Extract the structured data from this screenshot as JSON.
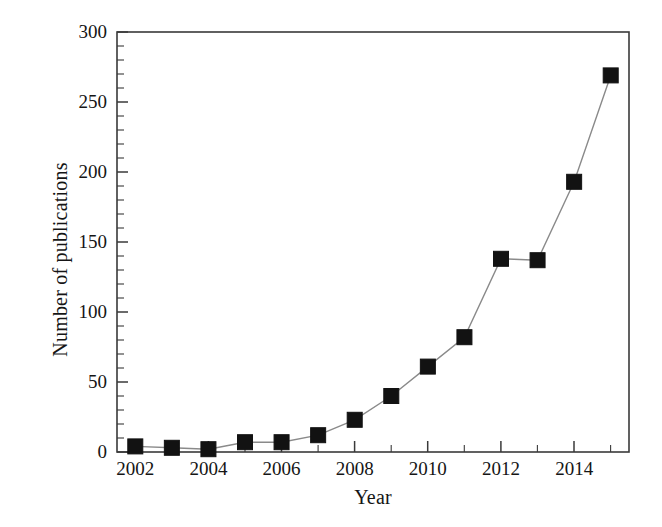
{
  "chart_data": {
    "type": "line",
    "title": "",
    "subtitle": "",
    "xlabel": "Year",
    "ylabel": "Number of publications",
    "x": [
      2002,
      2003,
      2004,
      2005,
      2006,
      2007,
      2008,
      2009,
      2010,
      2011,
      2012,
      2013,
      2014,
      2015
    ],
    "values": [
      4,
      3,
      2,
      7,
      7,
      12,
      23,
      40,
      61,
      82,
      138,
      137,
      193,
      269
    ],
    "series": [
      {
        "name": "Number of publications",
        "values": [
          4,
          3,
          2,
          7,
          7,
          12,
          23,
          40,
          61,
          82,
          138,
          137,
          193,
          269
        ]
      }
    ],
    "xlim": [
      2001.5,
      2015.5
    ],
    "ylim": [
      0,
      300
    ],
    "ytick_labels": [
      "0",
      "50",
      "100",
      "150",
      "200",
      "250",
      "300"
    ],
    "ytick_values": [
      0,
      50,
      100,
      150,
      200,
      250,
      300
    ],
    "yminor_step": 10,
    "xtick_labels": [
      "2002",
      "2004",
      "2006",
      "2008",
      "2010",
      "2012",
      "2014"
    ],
    "xtick_values": [
      2002,
      2004,
      2006,
      2008,
      2010,
      2012,
      2014
    ],
    "xminor_values": [
      2003,
      2005,
      2007,
      2009,
      2011,
      2013,
      2015
    ],
    "grid": false,
    "legend": false,
    "legend_position": "none",
    "marker": "filled-square",
    "marker_color": "#121212",
    "line_color": "#8a8a8a",
    "axis_color": "#3a3a3a",
    "background_color": "#ffffff"
  }
}
